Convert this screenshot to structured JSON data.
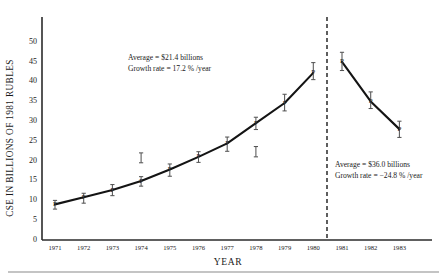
{
  "chart_data": {
    "type": "line",
    "title": "",
    "xlabel": "YEAR",
    "ylabel": "CSE IN BILLIONS OF 1981 RUBLES",
    "xlim": [
      1970.5,
      1983.8
    ],
    "ylim": [
      0,
      52
    ],
    "yticks": [
      0,
      5,
      10,
      15,
      20,
      25,
      30,
      35,
      40,
      45,
      50
    ],
    "xticks": [
      1971,
      1972,
      1973,
      1974,
      1975,
      1976,
      1977,
      1978,
      1979,
      1980,
      1981,
      1982,
      1983
    ],
    "grid": false,
    "legend": "none",
    "marker_label": "P",
    "series": [
      {
        "name": "rising-segment",
        "x": [
          1971,
          1972,
          1973,
          1974,
          1975,
          1976,
          1977,
          1978,
          1979,
          1980
        ],
        "values": [
          9.0,
          10.8,
          12.6,
          14.9,
          17.8,
          21.0,
          24.4,
          29.5,
          34.6,
          42.2
        ],
        "err_low": [
          7.8,
          9.3,
          11.2,
          13.6,
          16.1,
          19.6,
          22.4,
          27.9,
          32.6,
          40.5
        ],
        "err_high": [
          10.0,
          11.8,
          14.0,
          16.0,
          19.2,
          22.3,
          26.0,
          31.0,
          36.8,
          44.8
        ]
      },
      {
        "name": "declining-segment",
        "x": [
          1981,
          1982,
          1983
        ],
        "values": [
          45.0,
          35.0,
          28.0
        ],
        "err_low": [
          42.8,
          33.2,
          25.9
        ],
        "err_high": [
          47.4,
          37.4,
          30.0
        ]
      }
    ],
    "floating_markers": [
      {
        "x": 1974,
        "low": 19.5,
        "high": 22.0
      },
      {
        "x": 1978,
        "low": 21.0,
        "high": 23.6
      }
    ],
    "divider_x": 1980.5,
    "annotations": [
      {
        "id": "left-annotation",
        "line1": "Average  =  $21.4 billions",
        "line2": "Growth rate  =  17.2 % /year"
      },
      {
        "id": "right-annotation",
        "line1": "Average  =  $36.0 billions",
        "line2": "Growth rate  =  −24.8 % /year"
      }
    ]
  }
}
